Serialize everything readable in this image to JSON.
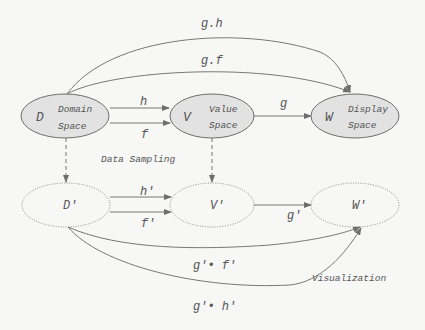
{
  "diagram": {
    "nodes": {
      "D": {
        "symbol": "D",
        "line1": "Domain",
        "line2": "Space"
      },
      "V": {
        "symbol": "V",
        "line1": "Value",
        "line2": "Space"
      },
      "W": {
        "symbol": "W",
        "line1": "Display",
        "line2": "Space"
      },
      "Dp": {
        "symbol": "D'"
      },
      "Vp": {
        "symbol": "V'"
      },
      "Wp": {
        "symbol": "W'"
      }
    },
    "edges": {
      "gh": "g.h",
      "gf": "g.f",
      "h": "h",
      "f": "f",
      "g": "g",
      "hp": "h'",
      "fp": "f'",
      "gp": "g'",
      "gpfp": "g'• f'",
      "gphp": "g'• h'"
    },
    "annotations": {
      "sampling": "Data Sampling",
      "visualization": "Visualization"
    },
    "colors": {
      "fill": "#e2e2e2",
      "stroke": "#6e6e6e",
      "text": "#555555",
      "background": "#f7f7f5"
    }
  }
}
